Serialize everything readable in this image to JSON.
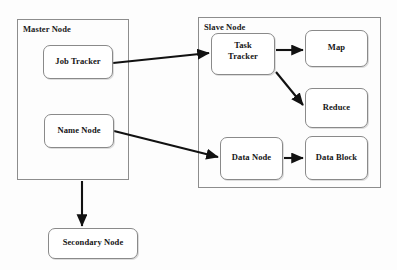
{
  "diagram": {
    "background_color": "#fdfdfd",
    "line_color": "#111111",
    "box_border_color": "#8a8a8a",
    "text_color": "#151515",
    "containers": [
      {
        "id": "master-node",
        "label": "Master Node",
        "x": 17,
        "y": 19,
        "w": 112,
        "h": 161
      },
      {
        "id": "slave-node",
        "label": "Slave Node",
        "x": 198,
        "y": 17,
        "w": 183,
        "h": 171
      }
    ],
    "nodes": [
      {
        "id": "job-tracker",
        "label": "Job Tracker",
        "x": 43,
        "y": 45,
        "w": 70,
        "h": 34,
        "lines": 1
      },
      {
        "id": "name-node",
        "label": "Name Node",
        "x": 44,
        "y": 114,
        "w": 70,
        "h": 34,
        "lines": 1
      },
      {
        "id": "secondary-node",
        "label": "Secondary Node",
        "x": 48,
        "y": 228,
        "w": 90,
        "h": 31,
        "lines": 1
      },
      {
        "id": "task-tracker",
        "label": "Task\nTracker",
        "x": 211,
        "y": 33,
        "w": 64,
        "h": 42,
        "lines": 2
      },
      {
        "id": "map",
        "label": "Map",
        "x": 305,
        "y": 30,
        "w": 63,
        "h": 37,
        "lines": 1
      },
      {
        "id": "reduce",
        "label": "Reduce",
        "x": 305,
        "y": 88,
        "w": 63,
        "h": 40,
        "lines": 1
      },
      {
        "id": "data-node",
        "label": "Data Node",
        "x": 220,
        "y": 137,
        "w": 63,
        "h": 43,
        "lines": 1
      },
      {
        "id": "data-block",
        "label": "Data Block",
        "x": 305,
        "y": 136,
        "w": 63,
        "h": 44,
        "lines": 1
      }
    ],
    "edges": [
      {
        "id": "job-tracker-to-task-tracker",
        "from": "job-tracker",
        "to": "task-tracker",
        "x1": 113,
        "y1": 63,
        "x2": 209,
        "y2": 53
      },
      {
        "id": "task-tracker-to-map",
        "from": "task-tracker",
        "to": "map",
        "x1": 276,
        "y1": 50,
        "x2": 303,
        "y2": 50
      },
      {
        "id": "task-tracker-to-reduce",
        "from": "task-tracker",
        "to": "reduce",
        "x1": 276,
        "y1": 72,
        "x2": 303,
        "y2": 105
      },
      {
        "id": "name-node-to-data-node",
        "from": "name-node",
        "to": "data-node",
        "x1": 114,
        "y1": 131,
        "x2": 218,
        "y2": 157
      },
      {
        "id": "data-node-to-data-block",
        "from": "data-node",
        "to": "data-block",
        "x1": 284,
        "y1": 158,
        "x2": 303,
        "y2": 158
      },
      {
        "id": "master-node-to-secondary-node",
        "from": "master-node",
        "to": "secondary-node",
        "x1": 82,
        "y1": 181,
        "x2": 82,
        "y2": 226
      }
    ]
  }
}
